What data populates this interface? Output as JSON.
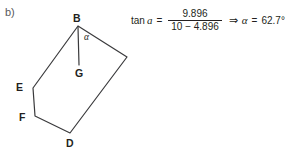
{
  "figure": {
    "part_label": "b)",
    "background_color": "#ffffff",
    "stroke_color": "#3a3a3c",
    "vertices": [
      {
        "name": "B",
        "label": "B",
        "x": 78,
        "y": 26
      },
      {
        "name": "C",
        "label": "",
        "x": 127,
        "y": 57
      },
      {
        "name": "D",
        "label": "D",
        "x": 70,
        "y": 133
      },
      {
        "name": "F",
        "label": "F",
        "x": 35,
        "y": 116
      },
      {
        "name": "E",
        "label": "E",
        "x": 33,
        "y": 88
      }
    ],
    "segment_BG": {
      "from": "B",
      "to": "G",
      "x1": 78,
      "y1": 27,
      "x2": 79,
      "y2": 65
    },
    "point_G": {
      "label": "G",
      "x": 79,
      "y": 65
    },
    "angle_label": "α"
  },
  "equation": {
    "tan_word": "tan",
    "variable": "a",
    "equals": "=",
    "numerator": "9.896",
    "denominator": "10 − 4.896",
    "implies": "⇒",
    "alpha": "α",
    "equals2": "=",
    "result": "62.7°"
  }
}
